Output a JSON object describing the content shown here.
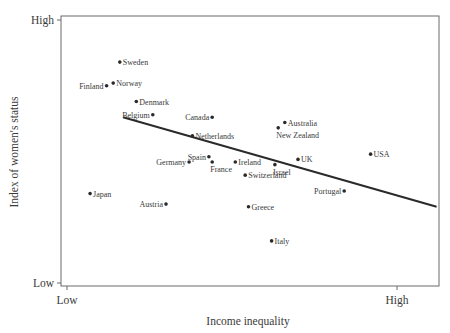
{
  "chart_data": {
    "type": "scatter",
    "title": "",
    "xlabel": "Income inequality",
    "ylabel": "Index of women's status",
    "x_ticks": [
      "Low",
      "High"
    ],
    "y_ticks": [
      "Low",
      "High"
    ],
    "xlim": [
      0,
      100
    ],
    "ylim": [
      0,
      100
    ],
    "grid": false,
    "legend": null,
    "points": [
      {
        "label": "Sweden",
        "x": 16,
        "y": 84,
        "label_side": "right"
      },
      {
        "label": "Finland",
        "x": 12,
        "y": 75,
        "label_side": "left"
      },
      {
        "label": "Norway",
        "x": 14,
        "y": 76,
        "label_side": "right"
      },
      {
        "label": "Denmark",
        "x": 21,
        "y": 69,
        "label_side": "right"
      },
      {
        "label": "Belgium",
        "x": 26,
        "y": 64,
        "label_side": "left"
      },
      {
        "label": "Canada",
        "x": 44,
        "y": 63,
        "label_side": "left"
      },
      {
        "label": "Netherlands",
        "x": 38,
        "y": 56,
        "label_side": "right"
      },
      {
        "label": "Australia",
        "x": 66,
        "y": 61,
        "label_side": "right"
      },
      {
        "label": "New Zealand",
        "x": 64,
        "y": 59,
        "label_side": "below"
      },
      {
        "label": "Spain",
        "x": 43,
        "y": 48,
        "label_side": "left"
      },
      {
        "label": "Germany",
        "x": 37,
        "y": 46,
        "label_side": "left"
      },
      {
        "label": "France",
        "x": 44,
        "y": 46,
        "label_side": "below"
      },
      {
        "label": "Ireland",
        "x": 51,
        "y": 46,
        "label_side": "right"
      },
      {
        "label": "Israel",
        "x": 63,
        "y": 45,
        "label_side": "below"
      },
      {
        "label": "UK",
        "x": 70,
        "y": 47,
        "label_side": "right"
      },
      {
        "label": "USA",
        "x": 92,
        "y": 49,
        "label_side": "right"
      },
      {
        "label": "Switzerland",
        "x": 54,
        "y": 41,
        "label_side": "right"
      },
      {
        "label": "Portugal",
        "x": 84,
        "y": 35,
        "label_side": "left"
      },
      {
        "label": "Japan",
        "x": 7,
        "y": 34,
        "label_side": "right"
      },
      {
        "label": "Austria",
        "x": 30,
        "y": 30,
        "label_side": "left"
      },
      {
        "label": "Greece",
        "x": 55,
        "y": 29,
        "label_side": "right"
      },
      {
        "label": "Italy",
        "x": 62,
        "y": 16,
        "label_side": "right"
      }
    ],
    "trend_line": {
      "x": [
        17,
        112
      ],
      "y": [
        63,
        29
      ]
    }
  }
}
